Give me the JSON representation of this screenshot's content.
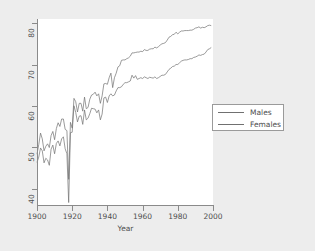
{
  "chart_data": {
    "type": "line",
    "title": "",
    "subtitle": "",
    "xlabel": "Year",
    "ylabel": "",
    "xlim": [
      1900,
      2000
    ],
    "ylim": [
      36,
      81
    ],
    "xticks": [
      1900,
      1920,
      1940,
      1960,
      1980,
      2000
    ],
    "yticks": [
      40,
      50,
      60,
      70,
      80
    ],
    "grid": false,
    "legend_position": "right",
    "legend": [
      "Males",
      "Females"
    ],
    "x": [
      1900,
      1901,
      1902,
      1903,
      1904,
      1905,
      1906,
      1907,
      1908,
      1909,
      1910,
      1911,
      1912,
      1913,
      1914,
      1915,
      1916,
      1917,
      1918,
      1919,
      1920,
      1921,
      1922,
      1923,
      1924,
      1925,
      1926,
      1927,
      1928,
      1929,
      1930,
      1931,
      1932,
      1933,
      1934,
      1935,
      1936,
      1937,
      1938,
      1939,
      1940,
      1941,
      1942,
      1943,
      1944,
      1945,
      1946,
      1947,
      1948,
      1949,
      1950,
      1951,
      1952,
      1953,
      1954,
      1955,
      1956,
      1957,
      1958,
      1959,
      1960,
      1961,
      1962,
      1963,
      1964,
      1965,
      1966,
      1967,
      1968,
      1969,
      1970,
      1971,
      1972,
      1973,
      1974,
      1975,
      1976,
      1977,
      1978,
      1979,
      1980,
      1981,
      1982,
      1983,
      1984,
      1985,
      1986,
      1987,
      1988,
      1989,
      1990,
      1991,
      1992,
      1993,
      1994,
      1995,
      1996,
      1997,
      1998,
      1999
    ],
    "series": [
      {
        "name": "Males",
        "color": "#707070",
        "values": [
          46.3,
          47.6,
          49.8,
          49.1,
          46.2,
          47.3,
          46.9,
          45.6,
          49.5,
          50.5,
          48.4,
          50.9,
          51.5,
          50.3,
          52.0,
          52.5,
          49.6,
          48.4,
          36.6,
          53.5,
          53.6,
          60.0,
          58.4,
          56.1,
          57.5,
          57.6,
          55.5,
          59.0,
          56.6,
          57.0,
          58.1,
          59.4,
          59.3,
          59.2,
          58.3,
          59.0,
          56.6,
          58.0,
          61.9,
          62.1,
          60.8,
          62.4,
          62.9,
          62.4,
          62.6,
          63.6,
          64.4,
          64.4,
          64.6,
          65.2,
          65.6,
          65.6,
          65.8,
          66.0,
          67.4,
          66.7,
          67.3,
          66.4,
          66.6,
          66.8,
          66.6,
          67.0,
          66.8,
          66.6,
          66.9,
          66.8,
          66.7,
          67.0,
          66.6,
          66.8,
          67.1,
          67.4,
          67.4,
          67.6,
          68.2,
          68.8,
          69.1,
          69.5,
          69.6,
          70.0,
          70.0,
          70.4,
          70.8,
          71.0,
          71.1,
          71.1,
          71.2,
          71.4,
          71.4,
          71.7,
          71.8,
          72.0,
          72.3,
          72.2,
          72.4,
          72.5,
          73.0,
          73.6,
          73.8,
          74.1
        ]
      },
      {
        "name": "Females",
        "color": "#707070",
        "values": [
          48.3,
          50.6,
          53.4,
          52.0,
          49.1,
          50.2,
          50.8,
          49.9,
          52.8,
          53.8,
          51.8,
          54.5,
          55.9,
          55.0,
          56.8,
          56.8,
          54.3,
          54.0,
          42.2,
          56.0,
          54.6,
          61.8,
          61.0,
          58.5,
          60.6,
          60.6,
          58.7,
          62.1,
          59.3,
          59.6,
          61.6,
          62.6,
          62.8,
          63.3,
          62.4,
          62.9,
          60.6,
          62.4,
          65.3,
          65.4,
          65.2,
          66.8,
          67.9,
          64.4,
          66.8,
          67.9,
          69.4,
          69.7,
          71.0,
          71.1,
          71.1,
          71.4,
          71.6,
          72.0,
          72.8,
          72.8,
          72.9,
          73.0,
          73.0,
          73.2,
          73.1,
          73.6,
          73.4,
          73.4,
          73.7,
          73.8,
          73.8,
          74.2,
          74.0,
          74.3,
          74.7,
          75.0,
          75.1,
          75.3,
          75.9,
          76.6,
          76.8,
          77.2,
          77.3,
          77.8,
          77.4,
          77.8,
          78.1,
          78.1,
          78.2,
          78.2,
          78.2,
          78.3,
          78.3,
          78.5,
          78.8,
          78.9,
          79.1,
          78.8,
          79.0,
          78.9,
          79.1,
          79.4,
          79.5,
          79.4
        ]
      }
    ]
  },
  "axes": {
    "x_tick_labels": [
      "1900",
      "1920",
      "1940",
      "1960",
      "1980",
      "2000"
    ],
    "y_tick_labels": [
      "40",
      "50",
      "60",
      "70",
      "80"
    ],
    "x_axis_title": "Year"
  },
  "legend": {
    "items": [
      {
        "label": "Males"
      },
      {
        "label": "Females"
      }
    ]
  },
  "colors": {
    "background": "#ededed",
    "plot_background": "#ffffff",
    "axis": "#8a8a8a",
    "line": "#707070",
    "text": "#4d4d4d"
  }
}
